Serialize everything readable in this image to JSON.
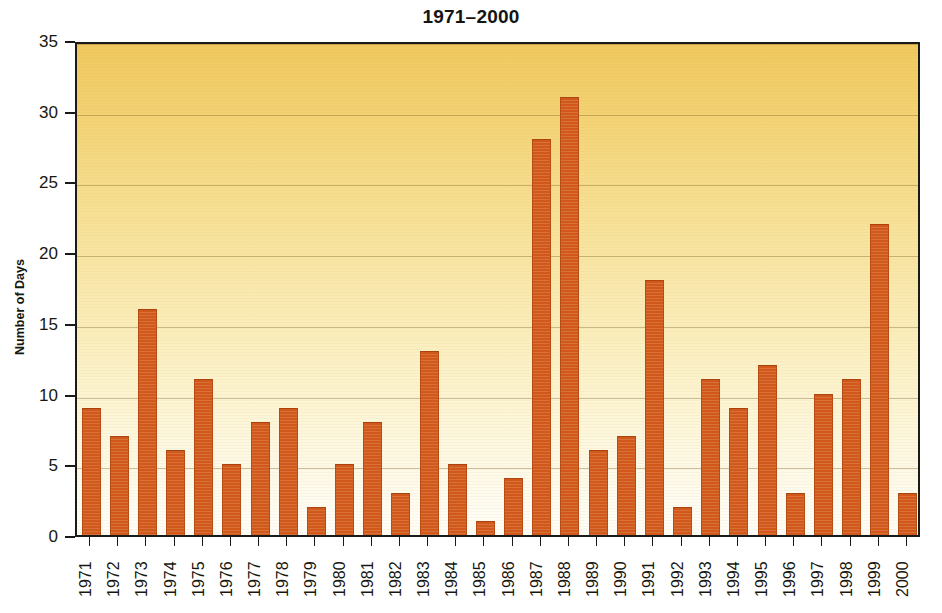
{
  "chart_data": {
    "type": "bar",
    "title": "1971–2000",
    "xlabel": "",
    "ylabel": "Number of Days",
    "ylim": [
      0,
      35
    ],
    "ytick_labels": [
      "0",
      "5",
      "10",
      "15",
      "20",
      "25",
      "30",
      "35"
    ],
    "yticks": [
      0,
      5,
      10,
      15,
      20,
      25,
      30,
      35
    ],
    "grid": true,
    "grid_axis": "y",
    "legend": "none",
    "categories": [
      "1971",
      "1972",
      "1973",
      "1974",
      "1975",
      "1976",
      "1977",
      "1978",
      "1979",
      "1980",
      "1981",
      "1982",
      "1983",
      "1984",
      "1985",
      "1986",
      "1987",
      "1988",
      "1989",
      "1990",
      "1991",
      "1992",
      "1993",
      "1994",
      "1995",
      "1996",
      "1997",
      "1998",
      "1999",
      "2000"
    ],
    "values": [
      9,
      7,
      16,
      6,
      11,
      5,
      8,
      9,
      2,
      5,
      8,
      3,
      13,
      5,
      1,
      4,
      28,
      31,
      6,
      7,
      18,
      2,
      11,
      9,
      12,
      3,
      10,
      11,
      22,
      3
    ],
    "bar_color": "#d1571a",
    "plot_background_top_color": "#f0c85e",
    "plot_background_bottom_color": "#fffdf7",
    "axis_color": "#1a1a16",
    "text_color": "#17170f"
  }
}
